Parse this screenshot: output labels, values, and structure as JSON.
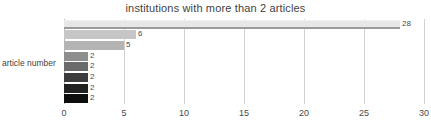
{
  "chart_data": {
    "type": "bar",
    "orientation": "horizontal",
    "title": "institutions  with more than 2 articles",
    "xlabel": "",
    "ylabel": "article number",
    "categories": [
      "1",
      "2",
      "3",
      "4",
      "5",
      "6",
      "7",
      "8"
    ],
    "values": [
      28,
      6,
      5,
      2,
      2,
      2,
      2,
      2
    ],
    "data_labels": [
      "28",
      "6",
      "5",
      "2",
      "2",
      "2",
      "2",
      "2"
    ],
    "xlim": [
      0,
      30
    ],
    "xticks": [
      0,
      5,
      10,
      15,
      20,
      25,
      30
    ],
    "xtick_labels": [
      "0",
      "5",
      "10",
      "15",
      "20",
      "25",
      "30"
    ],
    "grid": "vertical",
    "legend": "none",
    "bar_colors": [
      "#e7e7e7",
      "#c6c6c6",
      "#b4b4b4",
      "#8e8e8e",
      "#6a6a6a",
      "#3c3c3c",
      "#212121",
      "#0d0d0d"
    ],
    "gridline_color": "#d2d2d2",
    "text_color": "#3f3f3f",
    "background_color": "#ffffff"
  }
}
